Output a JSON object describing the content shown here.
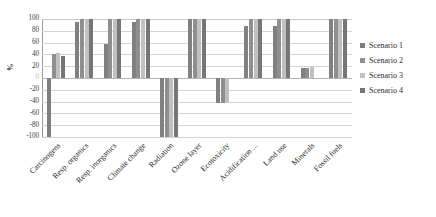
{
  "chart_data": {
    "type": "bar",
    "title": "",
    "xlabel": "",
    "ylabel": "%",
    "ylim": [
      -100,
      100
    ],
    "yticks": [
      100,
      80,
      60,
      40,
      20,
      0,
      -20,
      -40,
      -60,
      -80,
      -100
    ],
    "ytick_labels": [
      "100",
      "80",
      "60",
      "40",
      "20",
      "0",
      "-20",
      "-40",
      "-60",
      "-80",
      "-100"
    ],
    "grid": true,
    "legend_position": "right",
    "categories": [
      "Carcinogens",
      "Resp. organics",
      "Resp. inorganics",
      "Climate change",
      "Radiation",
      "Ozone layer",
      "Ecotoxicity",
      "Acidification ...",
      "Land use",
      "Minerals",
      "Fossil fuels"
    ],
    "series": [
      {
        "name": "Scenario 1",
        "color": "#808080",
        "values": [
          -100,
          95,
          58,
          95,
          -100,
          100,
          -43,
          88,
          88,
          17,
          100
        ]
      },
      {
        "name": "Scenario 2",
        "color": "#8f8f8f",
        "values": [
          40,
          100,
          100,
          100,
          -100,
          100,
          -43,
          100,
          100,
          17,
          100
        ]
      },
      {
        "name": "Scenario 3",
        "color": "#c0c0c0",
        "values": [
          42,
          100,
          100,
          100,
          -100,
          100,
          -40,
          100,
          100,
          18,
          100
        ]
      },
      {
        "name": "Scenario 4",
        "color": "#767676",
        "values": [
          37,
          100,
          100,
          100,
          -100,
          100,
          0,
          100,
          100,
          0,
          100
        ]
      }
    ]
  },
  "legend": {
    "items": [
      {
        "label": "Scenario 1",
        "color": "#808080"
      },
      {
        "label": "Scenario 2",
        "color": "#8f8f8f"
      },
      {
        "label": "Scenario 3",
        "color": "#c0c0c0"
      },
      {
        "label": "Scenario 4",
        "color": "#767676"
      }
    ]
  }
}
